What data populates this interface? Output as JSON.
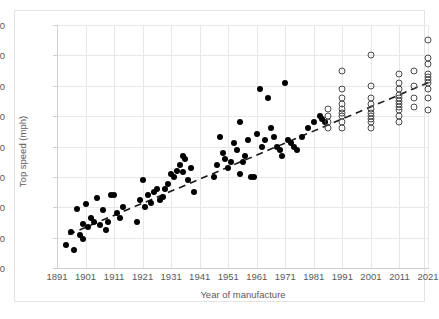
{
  "chart_data": {
    "type": "scatter",
    "title": "",
    "xlabel": "Year of manufacture",
    "ylabel": "Top speed (mph)",
    "xlim": [
      1891,
      2021
    ],
    "ylim": [
      0,
      160
    ],
    "xticks": [
      1891,
      1901,
      1911,
      1921,
      1931,
      1941,
      1951,
      1961,
      1971,
      1981,
      1991,
      2001,
      2011,
      2021
    ],
    "yticks": [
      0,
      20,
      40,
      60,
      80,
      100,
      120,
      140,
      160
    ],
    "grid": true,
    "legend": "none",
    "series": [
      {
        "name": "Historic records (filled markers)",
        "marker": "filled-circle",
        "color": "#000000",
        "points": [
          [
            1894,
            15
          ],
          [
            1896,
            24
          ],
          [
            1897,
            12
          ],
          [
            1898,
            39
          ],
          [
            1899,
            22
          ],
          [
            1900,
            19
          ],
          [
            1900,
            29
          ],
          [
            1901,
            42
          ],
          [
            1902,
            27
          ],
          [
            1903,
            33
          ],
          [
            1904,
            30
          ],
          [
            1905,
            46
          ],
          [
            1906,
            28
          ],
          [
            1907,
            38
          ],
          [
            1908,
            25
          ],
          [
            1909,
            30
          ],
          [
            1910,
            48
          ],
          [
            1911,
            48
          ],
          [
            1912,
            36
          ],
          [
            1913,
            33
          ],
          [
            1914,
            40
          ],
          [
            1919,
            30
          ],
          [
            1920,
            45
          ],
          [
            1921,
            58
          ],
          [
            1922,
            40
          ],
          [
            1923,
            48
          ],
          [
            1924,
            43
          ],
          [
            1925,
            50
          ],
          [
            1926,
            52
          ],
          [
            1927,
            45
          ],
          [
            1928,
            47
          ],
          [
            1929,
            52
          ],
          [
            1930,
            55
          ],
          [
            1931,
            62
          ],
          [
            1932,
            60
          ],
          [
            1933,
            64
          ],
          [
            1934,
            68
          ],
          [
            1935,
            74
          ],
          [
            1935,
            63
          ],
          [
            1936,
            72
          ],
          [
            1937,
            58
          ],
          [
            1938,
            66
          ],
          [
            1939,
            50
          ],
          [
            1946,
            60
          ],
          [
            1947,
            68
          ],
          [
            1948,
            86
          ],
          [
            1949,
            76
          ],
          [
            1950,
            72
          ],
          [
            1951,
            66
          ],
          [
            1952,
            70
          ],
          [
            1953,
            82
          ],
          [
            1954,
            78
          ],
          [
            1955,
            96
          ],
          [
            1955,
            62
          ],
          [
            1956,
            70
          ],
          [
            1957,
            74
          ],
          [
            1958,
            84
          ],
          [
            1959,
            60
          ],
          [
            1960,
            60
          ],
          [
            1961,
            88
          ],
          [
            1962,
            118
          ],
          [
            1963,
            80
          ],
          [
            1964,
            84
          ],
          [
            1965,
            112
          ],
          [
            1966,
            92
          ],
          [
            1967,
            86
          ],
          [
            1968,
            80
          ],
          [
            1969,
            78
          ],
          [
            1970,
            74
          ],
          [
            1971,
            122
          ],
          [
            1972,
            84
          ],
          [
            1973,
            82
          ],
          [
            1974,
            80
          ],
          [
            1975,
            78
          ],
          [
            1977,
            86
          ],
          [
            1979,
            92
          ],
          [
            1981,
            96
          ],
          [
            1983,
            100
          ],
          [
            1984,
            98
          ],
          [
            1985,
            96
          ]
        ]
      },
      {
        "name": "Modern production (hollow markers)",
        "marker": "open-circle",
        "color": "#4a4a4a",
        "points": [
          [
            1986,
            105
          ],
          [
            1986,
            100
          ],
          [
            1986,
            96
          ],
          [
            1986,
            92
          ],
          [
            1991,
            130
          ],
          [
            1991,
            118
          ],
          [
            1991,
            112
          ],
          [
            1991,
            108
          ],
          [
            1991,
            105
          ],
          [
            1991,
            102
          ],
          [
            1991,
            100
          ],
          [
            1991,
            96
          ],
          [
            1991,
            92
          ],
          [
            2001,
            140
          ],
          [
            2001,
            120
          ],
          [
            2001,
            112
          ],
          [
            2001,
            108
          ],
          [
            2001,
            105
          ],
          [
            2001,
            102
          ],
          [
            2001,
            100
          ],
          [
            2001,
            98
          ],
          [
            2001,
            96
          ],
          [
            2001,
            92
          ],
          [
            2011,
            128
          ],
          [
            2011,
            122
          ],
          [
            2011,
            118
          ],
          [
            2011,
            114
          ],
          [
            2011,
            112
          ],
          [
            2011,
            110
          ],
          [
            2011,
            108
          ],
          [
            2011,
            106
          ],
          [
            2011,
            104
          ],
          [
            2011,
            100
          ],
          [
            2011,
            96
          ],
          [
            2016,
            130
          ],
          [
            2016,
            120
          ],
          [
            2016,
            112
          ],
          [
            2016,
            106
          ],
          [
            2021,
            150
          ],
          [
            2021,
            138
          ],
          [
            2021,
            134
          ],
          [
            2021,
            128
          ],
          [
            2021,
            126
          ],
          [
            2021,
            124
          ],
          [
            2021,
            122
          ],
          [
            2021,
            118
          ],
          [
            2021,
            112
          ],
          [
            2021,
            104
          ]
        ]
      }
    ],
    "trendline": {
      "style": "dashed",
      "color": "#1a1a1a",
      "from": [
        1895,
        22
      ],
      "to": [
        2021,
        122
      ]
    }
  }
}
